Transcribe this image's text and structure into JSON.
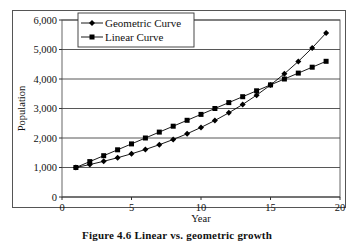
{
  "chart_data": {
    "type": "line",
    "title": "",
    "xlabel": "Year",
    "ylabel": "Population",
    "xlim": [
      0,
      20
    ],
    "ylim": [
      0,
      6000
    ],
    "x_ticks": [
      0,
      5,
      10,
      15,
      20
    ],
    "y_ticks": [
      0,
      1000,
      2000,
      3000,
      4000,
      5000,
      6000
    ],
    "y_tick_labels": [
      "0",
      "1,000",
      "2,000",
      "3,000",
      "4,000",
      "5,000",
      "6,000"
    ],
    "grid": "horizontal",
    "legend_position": "top-left",
    "x": [
      1,
      2,
      3,
      4,
      5,
      6,
      7,
      8,
      9,
      10,
      11,
      12,
      13,
      14,
      15,
      16,
      17,
      18,
      19
    ],
    "series": [
      {
        "name": "Geometric Curve",
        "marker": "diamond",
        "values": [
          1000,
          1100,
          1210,
          1331,
          1464,
          1611,
          1772,
          1949,
          2144,
          2358,
          2594,
          2853,
          3138,
          3452,
          3797,
          4177,
          4595,
          5054,
          5560
        ]
      },
      {
        "name": "Linear Curve",
        "marker": "square",
        "values": [
          1000,
          1200,
          1400,
          1600,
          1800,
          2000,
          2200,
          2400,
          2600,
          2800,
          3000,
          3200,
          3400,
          3600,
          3800,
          4000,
          4200,
          4400,
          4600
        ]
      }
    ]
  },
  "caption": "Figure 4.6   Linear vs. geometric growth"
}
